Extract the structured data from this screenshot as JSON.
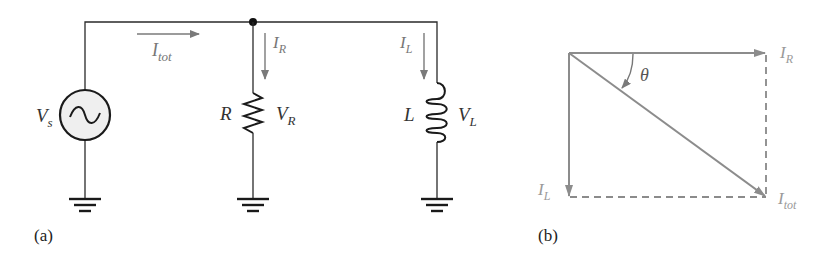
{
  "colors": {
    "wire": "#2a2a2a",
    "arrow": "#7a7a7a",
    "phasor": "#8c8c8c",
    "phasor_label": "#9a9a9a",
    "source_fill": "#efefef"
  },
  "circuit": {
    "caption": "(a)",
    "source": {
      "label_main": "V",
      "label_sub": "s",
      "icon": "ac-source-icon"
    },
    "total_current": {
      "label_main": "I",
      "label_sub": "tot"
    },
    "resistor_branch": {
      "component_label": "R",
      "current_main": "I",
      "current_sub": "R",
      "voltage_main": "V",
      "voltage_sub": "R"
    },
    "inductor_branch": {
      "component_label": "L",
      "current_main": "I",
      "current_sub": "L",
      "voltage_main": "V",
      "voltage_sub": "L"
    }
  },
  "phasor": {
    "caption": "(b)",
    "ir": {
      "main": "I",
      "sub": "R"
    },
    "il": {
      "main": "I",
      "sub": "L"
    },
    "itot": {
      "main": "I",
      "sub": "tot"
    },
    "angle": "θ"
  }
}
